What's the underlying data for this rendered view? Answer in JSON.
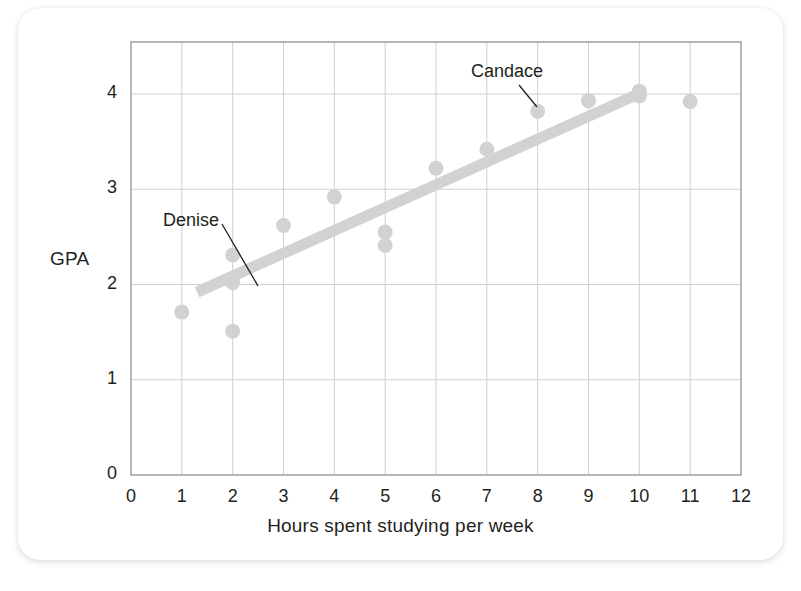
{
  "figure": {
    "background_color": "#ffffff",
    "card_color": "#ffffff",
    "accent_color": "#d4d4d4",
    "frame_color": "#a6a6a6",
    "grid_color": "#cfcfcf",
    "text_color": "#231f20"
  },
  "chart_data": {
    "type": "scatter",
    "title": "",
    "xlabel": "Hours spent studying per week",
    "ylabel": "GPA",
    "xlim": [
      0,
      12
    ],
    "ylim": [
      0,
      4.55
    ],
    "xticks": [
      0,
      1,
      2,
      3,
      4,
      5,
      6,
      7,
      8,
      9,
      10,
      11,
      12
    ],
    "xtick_labels": [
      "0",
      "1",
      "2",
      "3",
      "4",
      "5",
      "6",
      "7",
      "8",
      "9",
      "10",
      "11",
      "12"
    ],
    "yticks": [
      0,
      1,
      2,
      3,
      4
    ],
    "ytick_labels": [
      "0",
      "1",
      "2",
      "3",
      "4"
    ],
    "grid": true,
    "legend": false,
    "marker_color": "#d2d2d2",
    "points": [
      {
        "x": 1,
        "y": 1.71
      },
      {
        "x": 2,
        "y": 2.31
      },
      {
        "x": 2,
        "y": 2.02,
        "label": "Denise"
      },
      {
        "x": 2,
        "y": 1.51
      },
      {
        "x": 3,
        "y": 2.62
      },
      {
        "x": 4,
        "y": 2.92
      },
      {
        "x": 5,
        "y": 2.55
      },
      {
        "x": 5,
        "y": 2.41
      },
      {
        "x": 6,
        "y": 3.22
      },
      {
        "x": 7,
        "y": 3.42
      },
      {
        "x": 8,
        "y": 3.82,
        "label": "Candace"
      },
      {
        "x": 9,
        "y": 3.93
      },
      {
        "x": 10,
        "y": 4.03
      },
      {
        "x": 10,
        "y": 3.98
      },
      {
        "x": 11,
        "y": 3.92
      }
    ],
    "trendline": {
      "color": "#d2d2d2",
      "x_start": 1.3,
      "y_start": 1.92,
      "x_end": 10.1,
      "y_end": 4.03,
      "width": 11
    },
    "annotations": [
      {
        "text": "Denise",
        "text_x": 163,
        "text_y": 210,
        "leader_from_x": 222,
        "leader_from_y": 224,
        "leader_to_x": 258,
        "leader_to_y": 286
      },
      {
        "text": "Candace",
        "text_x": 471,
        "text_y": 61,
        "leader_from_x": 519,
        "leader_from_y": 85,
        "leader_to_x": 537,
        "leader_to_y": 107
      }
    ]
  }
}
